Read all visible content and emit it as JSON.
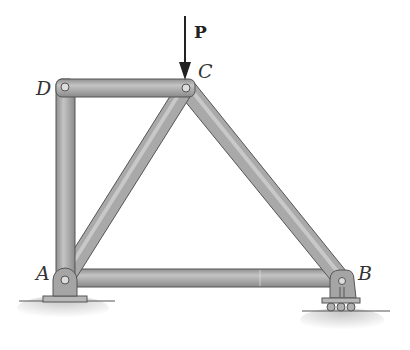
{
  "diagram": {
    "type": "truss",
    "load": {
      "label": "P",
      "direction": "down",
      "applied_at": "C"
    },
    "joints": [
      {
        "id": "A",
        "label": "A",
        "x": 65,
        "y": 278,
        "support": "pin"
      },
      {
        "id": "B",
        "label": "B",
        "x": 339,
        "y": 278,
        "support": "roller"
      },
      {
        "id": "C",
        "label": "C",
        "x": 186,
        "y": 87,
        "support": "none"
      },
      {
        "id": "D",
        "label": "D",
        "x": 65,
        "y": 87,
        "support": "none"
      }
    ],
    "members": [
      {
        "id": "AD",
        "from": "A",
        "to": "D"
      },
      {
        "id": "DC",
        "from": "D",
        "to": "C"
      },
      {
        "id": "AC",
        "from": "A",
        "to": "C"
      },
      {
        "id": "CB",
        "from": "C",
        "to": "B"
      },
      {
        "id": "AB",
        "from": "A",
        "to": "B"
      }
    ],
    "colors": {
      "member_fill": "#a9a9a9",
      "member_edge": "#555555",
      "ground": "#cfcfcf"
    }
  }
}
